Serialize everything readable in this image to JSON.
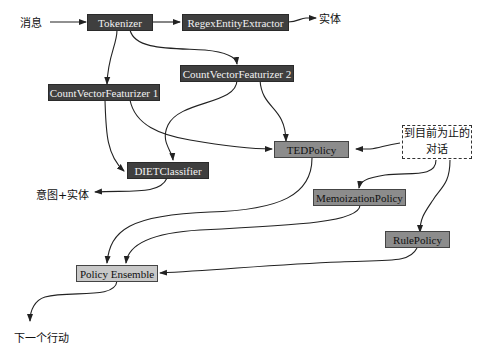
{
  "diagram": {
    "type": "flow",
    "title": "",
    "nodes": {
      "tokenizer": "Tokenizer",
      "regex_extractor": "RegexEntityExtractor",
      "cvf1": "CountVectorFeaturizer 1",
      "cvf2": "CountVectorFeaturizer 2",
      "diet": "DIETClassifier",
      "ted": "TEDPolicy",
      "memo": "MemoizationPolicy",
      "rule": "RulePolicy",
      "ensemble": "Policy Ensemble",
      "conversation_line1": "到目前为止的",
      "conversation_line2": "对话"
    },
    "labels": {
      "message": "消息",
      "entities": "实体",
      "intent_entities": "意图+实体",
      "next_action": "下一个行动"
    },
    "edges": [
      [
        "消息",
        "Tokenizer"
      ],
      [
        "Tokenizer",
        "RegexEntityExtractor"
      ],
      [
        "RegexEntityExtractor",
        "实体"
      ],
      [
        "Tokenizer",
        "CountVectorFeaturizer 1"
      ],
      [
        "Tokenizer",
        "CountVectorFeaturizer 2"
      ],
      [
        "CountVectorFeaturizer 1",
        "DIETClassifier"
      ],
      [
        "CountVectorFeaturizer 1",
        "TEDPolicy"
      ],
      [
        "CountVectorFeaturizer 2",
        "DIETClassifier"
      ],
      [
        "CountVectorFeaturizer 2",
        "TEDPolicy"
      ],
      [
        "DIETClassifier",
        "意图+实体"
      ],
      [
        "到目前为止的对话",
        "TEDPolicy"
      ],
      [
        "到目前为止的对话",
        "MemoizationPolicy"
      ],
      [
        "到目前为止的对话",
        "RulePolicy"
      ],
      [
        "TEDPolicy",
        "Policy Ensemble"
      ],
      [
        "MemoizationPolicy",
        "Policy Ensemble"
      ],
      [
        "RulePolicy",
        "Policy Ensemble"
      ],
      [
        "Policy Ensemble",
        "下一个行动"
      ]
    ],
    "colors": {
      "nlu_component": "#3f3f3f",
      "policy": "#8c8c8c",
      "ensemble": "#c8c8c8",
      "edge": "#222222"
    }
  }
}
